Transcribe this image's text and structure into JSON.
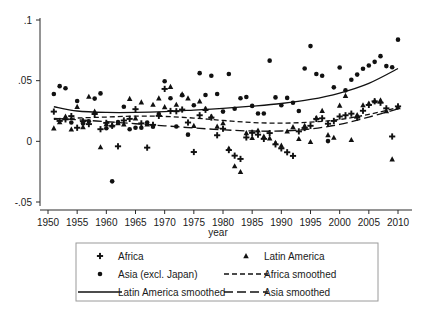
{
  "chart_data": {
    "type": "scatter",
    "title": "",
    "xlabel": "year",
    "ylabel": "",
    "xlim": [
      1948,
      2012
    ],
    "ylim": [
      -0.055,
      0.105
    ],
    "xticks": [
      1950,
      1955,
      1960,
      1965,
      1970,
      1975,
      1980,
      1985,
      1990,
      1995,
      2000,
      2005,
      2010
    ],
    "yticks": [
      -0.05,
      0,
      0.05,
      0.1
    ],
    "ytick_labels": [
      "-.05",
      "0",
      ".05",
      ".1"
    ],
    "grid": false,
    "legend_position": "below-plot",
    "series": [
      {
        "name": "Africa",
        "marker": "plus",
        "points": [
          [
            1951,
            0.0245
          ],
          [
            1952,
            0.0168
          ],
          [
            1953,
            0.0181
          ],
          [
            1954,
            0.0208
          ],
          [
            1955,
            0.0112
          ],
          [
            1956,
            0.0165
          ],
          [
            1957,
            0.0142
          ],
          [
            1958,
            0.0225
          ],
          [
            1959,
            0.01
          ],
          [
            1960,
            0.0152
          ],
          [
            1961,
            0.0128
          ],
          [
            1962,
            -0.0041
          ],
          [
            1963,
            0.0172
          ],
          [
            1964,
            0.0185
          ],
          [
            1965,
            0.0265
          ],
          [
            1966,
            0.0148
          ],
          [
            1967,
            -0.0052
          ],
          [
            1968,
            0.0136
          ],
          [
            1969,
            0.021
          ],
          [
            1970,
            0.0432
          ],
          [
            1971,
            0.025
          ],
          [
            1972,
            0.0248
          ],
          [
            1973,
            0.0262
          ],
          [
            1974,
            0.0155
          ],
          [
            1975,
            -0.0088
          ],
          [
            1976,
            0.0215
          ],
          [
            1977,
            0.026
          ],
          [
            1978,
            0.0196
          ],
          [
            1979,
            0.005
          ],
          [
            1980,
            0.0104
          ],
          [
            1981,
            -0.0072
          ],
          [
            1982,
            -0.0118
          ],
          [
            1983,
            -0.0145
          ],
          [
            1984,
            0.0032
          ],
          [
            1985,
            0.007
          ],
          [
            1986,
            0.0055
          ],
          [
            1987,
            0.002
          ],
          [
            1988,
            0.0068
          ],
          [
            1989,
            -0.0025
          ],
          [
            1990,
            -0.0058
          ],
          [
            1991,
            -0.009
          ],
          [
            1992,
            -0.012
          ],
          [
            1993,
            0.0082
          ],
          [
            1994,
            0.011
          ],
          [
            1995,
            0.0128
          ],
          [
            1996,
            0.0185
          ],
          [
            1997,
            0.019
          ],
          [
            1998,
            0.0145
          ],
          [
            1999,
            0.0168
          ],
          [
            2000,
            0.0205
          ],
          [
            2001,
            0.0215
          ],
          [
            2002,
            0.0228
          ],
          [
            2003,
            0.0195
          ],
          [
            2004,
            0.0252
          ],
          [
            2005,
            0.03
          ],
          [
            2006,
            0.033
          ],
          [
            2007,
            0.0318
          ],
          [
            2008,
            0.0272
          ],
          [
            2009,
            0.004
          ],
          [
            2010,
            0.0288
          ]
        ]
      },
      {
        "name": "Asia (excl. Japan)",
        "marker": "circle",
        "points": [
          [
            1951,
            0.039
          ],
          [
            1952,
            0.0455
          ],
          [
            1953,
            0.0438
          ],
          [
            1954,
            0.0155
          ],
          [
            1955,
            0.0332
          ],
          [
            1956,
            0.0148
          ],
          [
            1957,
            0.0165
          ],
          [
            1958,
            0.0352
          ],
          [
            1959,
            0.0395
          ],
          [
            1960,
            0.0108
          ],
          [
            1961,
            -0.033
          ],
          [
            1962,
            0.0158
          ],
          [
            1963,
            0.0285
          ],
          [
            1964,
            0.01
          ],
          [
            1965,
            0.0112
          ],
          [
            1966,
            0.0112
          ],
          [
            1967,
            0.0155
          ],
          [
            1968,
            0.012
          ],
          [
            1969,
            0.0225
          ],
          [
            1970,
            0.0495
          ],
          [
            1971,
            0.0355
          ],
          [
            1972,
            0.0122
          ],
          [
            1973,
            0.038
          ],
          [
            1974,
            0.0055
          ],
          [
            1975,
            0.0298
          ],
          [
            1976,
            0.0562
          ],
          [
            1977,
            0.0382
          ],
          [
            1978,
            0.054
          ],
          [
            1979,
            0.039
          ],
          [
            1980,
            0.0245
          ],
          [
            1981,
            0.0555
          ],
          [
            1982,
            0.0268
          ],
          [
            1983,
            0.0355
          ],
          [
            1984,
            0.0365
          ],
          [
            1985,
            0.0292
          ],
          [
            1986,
            0.023
          ],
          [
            1987,
            0.023
          ],
          [
            1988,
            0.0665
          ],
          [
            1989,
            0.0362
          ],
          [
            1990,
            0.0298
          ],
          [
            1991,
            0.0358
          ],
          [
            1992,
            0.0318
          ],
          [
            1993,
            0.025
          ],
          [
            1994,
            0.06
          ],
          [
            1995,
            0.0785
          ],
          [
            1996,
            0.0555
          ],
          [
            1997,
            0.054
          ],
          [
            1998,
            0.0002
          ],
          [
            1999,
            0.0445
          ],
          [
            2000,
            0.0608
          ],
          [
            2001,
            0.042
          ],
          [
            2002,
            0.0508
          ],
          [
            2003,
            0.055
          ],
          [
            2004,
            0.0598
          ],
          [
            2005,
            0.0625
          ],
          [
            2006,
            0.0655
          ],
          [
            2007,
            0.0702
          ],
          [
            2008,
            0.062
          ],
          [
            2009,
            0.061
          ],
          [
            2010,
            0.0838
          ]
        ]
      },
      {
        "name": "Latin America",
        "marker": "triangle",
        "points": [
          [
            1951,
            0.0108
          ],
          [
            1952,
            0.0158
          ],
          [
            1953,
            0.0205
          ],
          [
            1954,
            0.0098
          ],
          [
            1955,
            0.0285
          ],
          [
            1956,
            0.0118
          ],
          [
            1957,
            0.0368
          ],
          [
            1958,
            0.0245
          ],
          [
            1959,
            -0.0048
          ],
          [
            1960,
            0.0142
          ],
          [
            1961,
            0.0132
          ],
          [
            1962,
            0.015
          ],
          [
            1963,
            0.014
          ],
          [
            1964,
            0.035
          ],
          [
            1965,
            0.019
          ],
          [
            1966,
            0.0322
          ],
          [
            1967,
            0.014
          ],
          [
            1968,
            0.0302
          ],
          [
            1969,
            0.0355
          ],
          [
            1970,
            0.0282
          ],
          [
            1971,
            0.045
          ],
          [
            1972,
            0.0302
          ],
          [
            1973,
            0.0388
          ],
          [
            1974,
            0.0355
          ],
          [
            1975,
            0.0128
          ],
          [
            1976,
            0.033
          ],
          [
            1977,
            0.0268
          ],
          [
            1978,
            0.0205
          ],
          [
            1979,
            0.0122
          ],
          [
            1980,
            0.015
          ],
          [
            1981,
            -0.006
          ],
          [
            1982,
            -0.0205
          ],
          [
            1983,
            -0.0252
          ],
          [
            1984,
            0.0068
          ],
          [
            1985,
            0.0028
          ],
          [
            1986,
            0.009
          ],
          [
            1987,
            0.004
          ],
          [
            1988,
            0.0025
          ],
          [
            1989,
            -0.0012
          ],
          [
            1990,
            -0.0035
          ],
          [
            1991,
            0.0082
          ],
          [
            1992,
            0.0118
          ],
          [
            1993,
            0.002
          ],
          [
            1994,
            0.0128
          ],
          [
            1995,
            -0.0005
          ],
          [
            1996,
            0.0192
          ],
          [
            1997,
            0.0252
          ],
          [
            1998,
            0.0052
          ],
          [
            1999,
            0.003
          ],
          [
            2000,
            0.0295
          ],
          [
            2001,
            0.0375
          ],
          [
            2002,
            0.0012
          ],
          [
            2003,
            0.0218
          ],
          [
            2004,
            0.0298
          ],
          [
            2005,
            0.0312
          ],
          [
            2006,
            0.0332
          ],
          [
            2007,
            0.0338
          ],
          [
            2008,
            0.025
          ],
          [
            2009,
            -0.0148
          ],
          [
            2010,
            0.0282
          ]
        ]
      }
    ],
    "smoothed": [
      {
        "name": "Latin America smoothed",
        "style": "solid",
        "points": [
          [
            1951,
            0.0285
          ],
          [
            1955,
            0.025
          ],
          [
            1960,
            0.0238
          ],
          [
            1965,
            0.0238
          ],
          [
            1970,
            0.0245
          ],
          [
            1975,
            0.0258
          ],
          [
            1980,
            0.0272
          ],
          [
            1985,
            0.029
          ],
          [
            1990,
            0.0312
          ],
          [
            1995,
            0.0345
          ],
          [
            2000,
            0.0398
          ],
          [
            2005,
            0.0478
          ],
          [
            2010,
            0.06
          ]
        ]
      },
      {
        "name": "Africa smoothed",
        "style": "dashed-fine",
        "points": [
          [
            1951,
            0.0182
          ],
          [
            1955,
            0.0192
          ],
          [
            1960,
            0.02
          ],
          [
            1965,
            0.0208
          ],
          [
            1970,
            0.0205
          ],
          [
            1975,
            0.0192
          ],
          [
            1980,
            0.0172
          ],
          [
            1985,
            0.0155
          ],
          [
            1990,
            0.015
          ],
          [
            1995,
            0.0158
          ],
          [
            2000,
            0.018
          ],
          [
            2005,
            0.0222
          ],
          [
            2010,
            0.0278
          ]
        ]
      },
      {
        "name": "Asia smoothed",
        "style": "dashed-long",
        "points": [
          [
            1951,
            0.019
          ],
          [
            1955,
            0.0178
          ],
          [
            1960,
            0.0162
          ],
          [
            1965,
            0.0145
          ],
          [
            1970,
            0.0128
          ],
          [
            1975,
            0.011
          ],
          [
            1980,
            0.0095
          ],
          [
            1985,
            0.0085
          ],
          [
            1990,
            0.0085
          ],
          [
            1995,
            0.0102
          ],
          [
            2000,
            0.014
          ],
          [
            2005,
            0.02
          ],
          [
            2010,
            0.0268
          ]
        ]
      }
    ]
  },
  "axes": {
    "x_title": "year",
    "x_tick_labels": [
      "1950",
      "1955",
      "1960",
      "1965",
      "1970",
      "1975",
      "1980",
      "1985",
      "1990",
      "1995",
      "2000",
      "2005",
      "2010"
    ],
    "y_tick_labels": [
      "-.05",
      "0",
      ".05",
      ".1"
    ]
  },
  "legend": {
    "entries": [
      {
        "label": "Africa",
        "symbol": "plus"
      },
      {
        "label": "Latin America",
        "symbol": "triangle"
      },
      {
        "label": "Asia (excl. Japan)",
        "symbol": "circle"
      },
      {
        "label": "Africa smoothed",
        "symbol": "dashed-fine"
      },
      {
        "label": "Latin America smoothed",
        "symbol": "solid"
      },
      {
        "label": "Asia smoothed",
        "symbol": "dashed-long"
      }
    ]
  },
  "colors": {
    "ink": "#111111",
    "axis": "#2b2b2b",
    "legend_border": "#9a9a9a",
    "background": "#ffffff"
  }
}
